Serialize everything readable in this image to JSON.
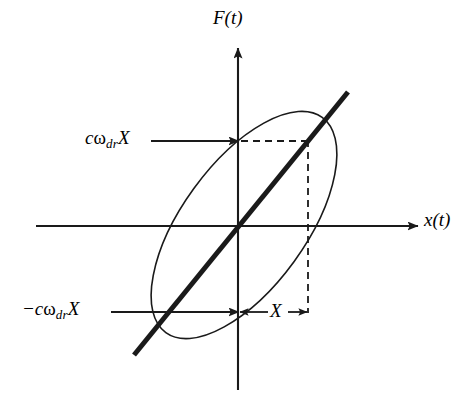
{
  "figure": {
    "background_color": "#ffffff",
    "stroke_color": "#1a1a1a",
    "axes": {
      "vertical_axis_label": "F(t)",
      "horizontal_axis_label": "x(t)",
      "origin": {
        "x": 238,
        "y": 226
      }
    },
    "annotations": [
      {
        "name": "upper-force-amplitude",
        "prefix": "c",
        "omega": "ω",
        "subscript": "dr",
        "variable": "X",
        "full_text": "cωdrX",
        "points_to": {
          "x": 238,
          "y": 141
        }
      },
      {
        "name": "lower-force-amplitude",
        "prefix": "−c",
        "omega": "ω",
        "subscript": "dr",
        "variable": "X",
        "full_text": "−cωdrX",
        "points_to": {
          "x": 238,
          "y": 312
        }
      },
      {
        "name": "displacement-amplitude",
        "full_text": "X",
        "span_from": {
          "x": 238,
          "y": 312
        },
        "span_to": {
          "x": 308,
          "y": 312
        }
      }
    ],
    "ellipse": {
      "center_x": 244,
      "center_y": 225,
      "semi_major": 133,
      "semi_minor": 62,
      "rotation_deg": -54
    },
    "diagonal_line": {
      "x1": 134,
      "y1": 355,
      "x2": 348,
      "y2": 92,
      "stroke_width": 5
    },
    "dashed_guides": [
      {
        "name": "horizontal-guide",
        "x1": 240,
        "y1": 141,
        "x2": 309,
        "y2": 141
      },
      {
        "name": "vertical-guide",
        "x1": 308,
        "y1": 141,
        "x2": 308,
        "y2": 312
      }
    ]
  }
}
